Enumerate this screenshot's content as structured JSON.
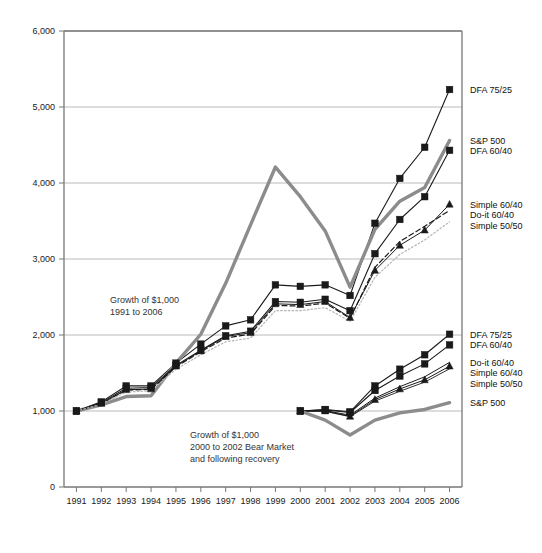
{
  "chart_data": {
    "type": "line",
    "title": "",
    "subtitle": "",
    "xlabel": "",
    "ylabel": "",
    "categories": [
      "1991",
      "1992",
      "1993",
      "1994",
      "1995",
      "1996",
      "1997",
      "1998",
      "1999",
      "2000",
      "2001",
      "2002",
      "2003",
      "2004",
      "2005",
      "2006"
    ],
    "ylim": [
      0,
      6000
    ],
    "ytick_labels": [
      "0",
      "1,000",
      "2,000",
      "3,000",
      "4,000",
      "5,000",
      "6,000"
    ],
    "ytick_values": [
      0,
      1000,
      2000,
      3000,
      4000,
      5000,
      6000
    ],
    "grid": "horizontal",
    "legend_position": "right-of-plot",
    "annotations": [
      {
        "name": "growth-1991-2006-annotation",
        "lines": [
          "Growth of $1,000",
          "1991 to 2006"
        ]
      },
      {
        "name": "growth-bear-market-annotation",
        "lines": [
          "Growth of $1,000",
          "2000 to 2002 Bear Market",
          "and following recovery"
        ]
      }
    ],
    "series": [
      {
        "name": "DFA 75/25",
        "group": "1991-2006",
        "color": "#1a1a1a",
        "marker": "square",
        "style": "solid",
        "width": 1.1,
        "x": [
          "1991",
          "1992",
          "1993",
          "1994",
          "1995",
          "1996",
          "1997",
          "1998",
          "1999",
          "2000",
          "2001",
          "2002",
          "2003",
          "2004",
          "2005",
          "2006"
        ],
        "values": [
          1000,
          1120,
          1330,
          1330,
          1630,
          1880,
          2120,
          2200,
          2660,
          2640,
          2660,
          2520,
          3470,
          4060,
          4470,
          5230
        ]
      },
      {
        "name": "S&P 500",
        "group": "1991-2006",
        "color": "#8c8c8c",
        "marker": "none",
        "style": "solid",
        "width": 3.4,
        "x": [
          "1991",
          "1992",
          "1993",
          "1994",
          "1995",
          "1996",
          "1997",
          "1998",
          "1999",
          "2000",
          "2001",
          "2002",
          "2003",
          "2004",
          "2005",
          "2006"
        ],
        "values": [
          1000,
          1080,
          1190,
          1200,
          1630,
          2010,
          2680,
          3450,
          4210,
          3820,
          3370,
          2630,
          3390,
          3760,
          3940,
          4560
        ]
      },
      {
        "name": "DFA 60/40",
        "group": "1991-2006",
        "color": "#1a1a1a",
        "marker": "square",
        "style": "solid",
        "width": 1.1,
        "x": [
          "1991",
          "1992",
          "1993",
          "1994",
          "1995",
          "1996",
          "1997",
          "1998",
          "1999",
          "2000",
          "2001",
          "2002",
          "2003",
          "2004",
          "2005",
          "2006"
        ],
        "values": [
          1000,
          1110,
          1300,
          1310,
          1600,
          1800,
          1990,
          2050,
          2440,
          2430,
          2470,
          2320,
          3070,
          3520,
          3820,
          4430
        ]
      },
      {
        "name": "Simple 60/40",
        "group": "1991-2006",
        "color": "#1a1a1a",
        "marker": "triangle",
        "style": "solid",
        "width": 1.0,
        "x": [
          "1991",
          "1992",
          "1993",
          "1994",
          "1995",
          "1996",
          "1997",
          "1998",
          "1999",
          "2000",
          "2001",
          "2002",
          "2003",
          "2004",
          "2005",
          "2006"
        ],
        "values": [
          1000,
          1100,
          1280,
          1290,
          1590,
          1790,
          1980,
          2030,
          2410,
          2400,
          2440,
          2230,
          2850,
          3180,
          3380,
          3720
        ]
      },
      {
        "name": "Do-it 60/40",
        "group": "1991-2006",
        "color": "#1a1a1a",
        "marker": "none",
        "style": "dashed",
        "width": 1.2,
        "x": [
          "1991",
          "1992",
          "1993",
          "1994",
          "1995",
          "1996",
          "1997",
          "1998",
          "1999",
          "2000",
          "2001",
          "2002",
          "2003",
          "2004",
          "2005",
          "2006"
        ],
        "values": [
          1000,
          1095,
          1275,
          1285,
          1580,
          1780,
          1960,
          2010,
          2390,
          2380,
          2420,
          2220,
          2890,
          3230,
          3430,
          3640
        ]
      },
      {
        "name": "Simple 50/50",
        "group": "1991-2006",
        "color": "#b5b5b5",
        "marker": "none",
        "style": "dotted",
        "width": 1.2,
        "x": [
          "1991",
          "1992",
          "1993",
          "1994",
          "1995",
          "1996",
          "1997",
          "1998",
          "1999",
          "2000",
          "2001",
          "2002",
          "2003",
          "2004",
          "2005",
          "2006"
        ],
        "values": [
          1000,
          1090,
          1250,
          1265,
          1550,
          1740,
          1910,
          1960,
          2320,
          2320,
          2360,
          2180,
          2760,
          3060,
          3250,
          3490
        ]
      },
      {
        "name": "DFA 75/25",
        "group": "2000-2006",
        "color": "#1a1a1a",
        "marker": "square",
        "style": "solid",
        "width": 1.1,
        "x": [
          "2000",
          "2001",
          "2002",
          "2003",
          "2004",
          "2005",
          "2006"
        ],
        "values": [
          1000,
          1020,
          990,
          1330,
          1550,
          1740,
          2010
        ]
      },
      {
        "name": "DFA 60/40",
        "group": "2000-2006",
        "color": "#1a1a1a",
        "marker": "square",
        "style": "solid",
        "width": 1.1,
        "x": [
          "2000",
          "2001",
          "2002",
          "2003",
          "2004",
          "2005",
          "2006"
        ],
        "values": [
          1000,
          1015,
          980,
          1270,
          1460,
          1620,
          1870
        ]
      },
      {
        "name": "Do-it 60/40",
        "group": "2000-2006",
        "color": "#1a1a1a",
        "marker": "none",
        "style": "solid",
        "width": 1.0,
        "x": [
          "2000",
          "2001",
          "2002",
          "2003",
          "2004",
          "2005",
          "2006"
        ],
        "values": [
          1000,
          1005,
          945,
          1170,
          1320,
          1450,
          1640
        ]
      },
      {
        "name": "Simple 60/40",
        "group": "2000-2006",
        "color": "#1a1a1a",
        "marker": "triangle",
        "style": "solid",
        "width": 1.0,
        "x": [
          "2000",
          "2001",
          "2002",
          "2003",
          "2004",
          "2005",
          "2006"
        ],
        "values": [
          1000,
          1000,
          930,
          1150,
          1290,
          1410,
          1590
        ]
      },
      {
        "name": "Simple 50/50",
        "group": "2000-2006",
        "color": "#1a1a1a",
        "marker": "none",
        "style": "solid",
        "width": 0.9,
        "x": [
          "2000",
          "2001",
          "2002",
          "2003",
          "2004",
          "2005",
          "2006"
        ],
        "values": [
          1000,
          995,
          925,
          1130,
          1260,
          1380,
          1555
        ]
      },
      {
        "name": "S&P 500",
        "group": "2000-2006",
        "color": "#8c8c8c",
        "marker": "none",
        "style": "solid",
        "width": 3.4,
        "x": [
          "2000",
          "2001",
          "2002",
          "2003",
          "2004",
          "2005",
          "2006"
        ],
        "values": [
          1000,
          880,
          685,
          880,
          975,
          1020,
          1110
        ]
      }
    ],
    "legend_top": [
      {
        "label": "DFA 75/25",
        "series": "DFA 75/25",
        "value": 5230
      },
      {
        "label": "S&P 500",
        "series": "S&P 500",
        "value": 4560
      },
      {
        "label": "DFA 60/40",
        "series": "DFA 60/40",
        "value": 4430
      },
      {
        "label": "Simple 60/40",
        "series": "Simple 60/40",
        "value": 3720
      },
      {
        "label": "Do-it 60/40",
        "series": "Do-it 60/40",
        "value": 3640
      },
      {
        "label": "Simple 50/50",
        "series": "Simple 50/50",
        "value": 3490
      }
    ],
    "legend_bottom": [
      {
        "label": "DFA 75/25",
        "series": "DFA 75/25",
        "value": 2010
      },
      {
        "label": "DFA 60/40",
        "series": "DFA 60/40",
        "value": 1870
      },
      {
        "label": "Do-it 60/40",
        "series": "Do-it 60/40",
        "value": 1640
      },
      {
        "label": "Simple 60/40",
        "series": "Simple 60/40",
        "value": 1590
      },
      {
        "label": "Simple 50/50",
        "series": "Simple 50/50",
        "value": 1555
      },
      {
        "label": "S&P 500",
        "series": "S&P 500",
        "value": 1110
      }
    ],
    "colors": {
      "sp500": "#8c8c8c",
      "dfa": "#1a1a1a",
      "grid": "#a8a8a8",
      "axis": "#777777",
      "simple_50_50_top": "#b5b5b5"
    }
  }
}
